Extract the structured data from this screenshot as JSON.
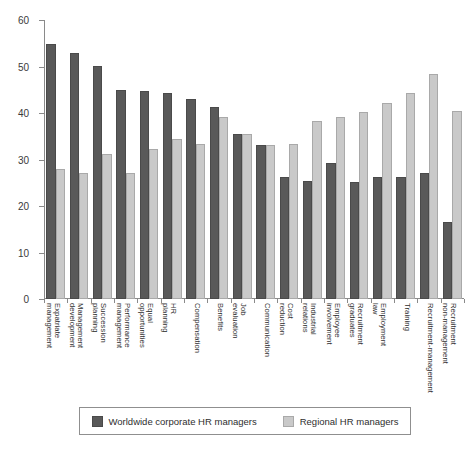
{
  "chart_data": {
    "type": "bar",
    "title": "",
    "subtitle": "",
    "xlabel": "",
    "ylabel": "",
    "ylim": [
      0,
      60
    ],
    "ytick_step": 10,
    "yticks": [
      0,
      10,
      20,
      30,
      40,
      50,
      60
    ],
    "grid": false,
    "legend_position": "bottom",
    "orientation": "vertical",
    "grouping": "clustered",
    "categories": [
      "Expatriate management",
      "Management development",
      "Succession planning",
      "Performance management",
      "Equal opportunities",
      "HR planning",
      "Compensation",
      "Benefits",
      "Job evaluation",
      "Communication",
      "Cost reduction",
      "Industrial relations",
      "Employee involvement",
      "Recruitment graduates",
      "Employment law",
      "Training",
      "Recruitment-management",
      "Recruitment non-management"
    ],
    "series": [
      {
        "name": "Worldwide corporate HR managers",
        "color": "#595959",
        "values": [
          54.8,
          52.8,
          50.1,
          45.0,
          44.8,
          44.2,
          43.0,
          41.2,
          35.5,
          33.2,
          26.2,
          25.3,
          29.3,
          25.2,
          26.2,
          26.3,
          27.2,
          16.5
        ]
      },
      {
        "name": "Regional HR managers",
        "color": "#c9c9c9",
        "values": [
          28.0,
          27.1,
          31.2,
          27.2,
          32.3,
          34.4,
          33.4,
          39.2,
          35.4,
          33.2,
          33.4,
          38.3,
          39.2,
          40.2,
          42.2,
          44.3,
          48.4,
          40.4
        ]
      }
    ]
  },
  "legend": {
    "items": [
      {
        "label": "Worldwide corporate HR managers",
        "swatch": "dark"
      },
      {
        "label": "Regional HR managers",
        "swatch": "light"
      }
    ]
  }
}
